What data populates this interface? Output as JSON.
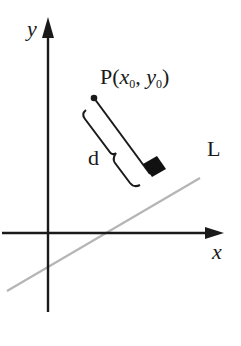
{
  "diagram": {
    "labels": {
      "y_axis": "y",
      "x_axis": "x",
      "line": "L",
      "distance": "d",
      "point_name": "P",
      "point_open": "(",
      "point_x": "x",
      "point_x_sub": "0",
      "point_sep": ", ",
      "point_y": "y",
      "point_y_sub": "0",
      "point_close": ")"
    },
    "colors": {
      "axes": "#1a1a1a",
      "line_L": "#b5b5b5",
      "perpendicular": "#1a1a1a",
      "right_angle_marker": "#111111"
    }
  }
}
